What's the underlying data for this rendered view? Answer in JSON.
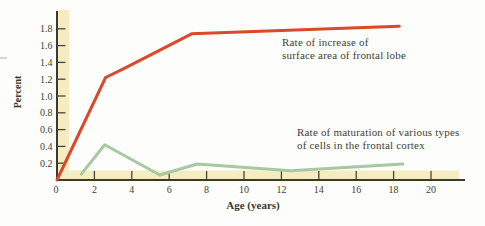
{
  "figure": {
    "background": "#fdfdfb",
    "band_color": "#f5ecc2",
    "axis_color": "#3d3931",
    "tick_color": "#4a453c",
    "text_color": "#433d34"
  },
  "chart_data": {
    "type": "line",
    "title": "",
    "xlabel": "Age (years)",
    "ylabel": "Percent",
    "xlim": [
      0,
      21.8
    ],
    "ylim": [
      0,
      2.0
    ],
    "x_ticks": [
      2,
      4,
      6,
      8,
      10,
      12,
      14,
      16,
      18,
      20
    ],
    "y_ticks": [
      0.2,
      0.4,
      0.6,
      0.8,
      1.0,
      1.2,
      1.4,
      1.6,
      1.8
    ],
    "origin_label": "0",
    "grid": false,
    "legend_position": "inline-annotations",
    "series": [
      {
        "name": "Rate of increase of surface area of frontal lobe",
        "color": "#d9492c",
        "line_width": 3,
        "x": [
          0,
          2.6,
          3.6,
          7.2,
          18.3
        ],
        "y": [
          0,
          1.22,
          1.33,
          1.74,
          1.83
        ],
        "annotation_lines": [
          "Rate of increase of",
          "surface area of frontal lobe"
        ]
      },
      {
        "name": "Rate of maturation of various types of cells in the frontal cortex",
        "color": "#a7c8a0",
        "line_width": 3,
        "x": [
          1.3,
          2.55,
          5.5,
          7.5,
          12.5,
          18.5
        ],
        "y": [
          0.07,
          0.42,
          0.06,
          0.19,
          0.11,
          0.19
        ],
        "annotation_lines": [
          "Rate of maturation of various types",
          "of cells in the frontal cortex"
        ]
      }
    ]
  }
}
